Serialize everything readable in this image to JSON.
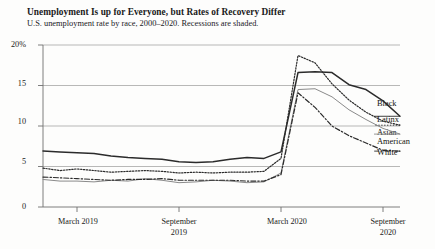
{
  "chart_data": {
    "type": "line",
    "title": "Unemployment Is up for Everyone,  but Rates of Recovery Differ",
    "subtitle": "U.S. unemployment rate by race, 2000–2020. Recessions are shaded.",
    "xlabel": "",
    "ylabel": "",
    "ylim": [
      0,
      20
    ],
    "yticks": [
      "20%",
      "15",
      "10",
      "5",
      "0"
    ],
    "ytick_values": [
      20,
      15,
      10,
      5,
      0
    ],
    "grid": true,
    "grid_axis": "y",
    "legend_position": "right-inline-labels",
    "shaded_regions": "recessions are shaded",
    "xticks": [
      {
        "label": "March 2019",
        "lines": [
          "March 2019"
        ]
      },
      {
        "label": "September 2019",
        "lines": [
          "September",
          "2019"
        ]
      },
      {
        "label": "March 2020",
        "lines": [
          "March 2020"
        ]
      },
      {
        "label": "September 2020",
        "lines": [
          "September",
          "2020"
        ]
      }
    ],
    "x": [
      "2019-01",
      "2019-02",
      "2019-03",
      "2019-04",
      "2019-05",
      "2019-06",
      "2019-07",
      "2019-08",
      "2019-09",
      "2019-10",
      "2019-11",
      "2019-12",
      "2020-01",
      "2020-02",
      "2020-03",
      "2020-04",
      "2020-05",
      "2020-06",
      "2020-07",
      "2020-08",
      "2020-09",
      "2020-10"
    ],
    "series": [
      {
        "name": "Black",
        "style": "solid",
        "color": "#2b2b2b",
        "label_lines": [
          "Black"
        ],
        "values": [
          6.9,
          6.8,
          6.7,
          6.6,
          6.3,
          6.1,
          6.0,
          5.9,
          5.6,
          5.5,
          5.6,
          5.9,
          6.1,
          6.0,
          6.8,
          16.6,
          16.7,
          16.6,
          15.1,
          14.5,
          13.1,
          11.2
        ]
      },
      {
        "name": "Latinx",
        "style": "dotted",
        "color": "#2b2b2b",
        "label_lines": [
          "Latinx"
        ],
        "values": [
          4.8,
          4.5,
          4.7,
          4.5,
          4.3,
          4.4,
          4.5,
          4.4,
          4.2,
          4.3,
          4.2,
          4.3,
          4.3,
          4.4,
          6.0,
          18.7,
          17.8,
          15.2,
          13.2,
          11.7,
          10.6,
          10.1
        ]
      },
      {
        "name": "Asian American",
        "style": "solid-gray",
        "color": "#8a8a8a",
        "label_lines": [
          "Asian",
          "American"
        ],
        "values": [
          3.4,
          3.2,
          3.2,
          3.1,
          3.3,
          3.2,
          3.5,
          3.3,
          3.0,
          3.1,
          3.3,
          3.2,
          3.0,
          3.1,
          4.2,
          14.5,
          14.6,
          13.6,
          12.0,
          10.8,
          9.7,
          9.0
        ]
      },
      {
        "name": "White",
        "style": "dash-dot",
        "color": "#2b2b2b",
        "label_lines": [
          "White"
        ],
        "values": [
          3.7,
          3.6,
          3.5,
          3.4,
          3.3,
          3.4,
          3.4,
          3.5,
          3.3,
          3.3,
          3.3,
          3.3,
          3.2,
          3.2,
          4.0,
          14.1,
          12.3,
          10.0,
          8.8,
          7.9,
          7.0,
          6.9
        ]
      }
    ]
  },
  "axis_labels": {
    "y": [
      "20%",
      "15",
      "10",
      "5",
      "0"
    ],
    "x": [
      "March 2019",
      "September",
      "2019",
      "March 2020",
      "September",
      "2020"
    ]
  },
  "series_labels": {
    "black": "Black",
    "latinx": "Latinx",
    "asian_1": "Asian",
    "asian_2": "American",
    "white": "White"
  },
  "colors": {
    "ink": "#2b2b2b",
    "gray_series": "#8a8a8a",
    "grid": "#9a9a9a",
    "axis": "#6f6f6f",
    "background": "#fdfdfc"
  }
}
